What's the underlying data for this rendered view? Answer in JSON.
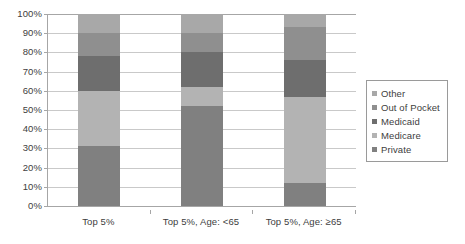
{
  "chart_data": {
    "type": "bar",
    "stacked": true,
    "title": "",
    "xlabel": "",
    "ylabel": "",
    "ylim": [
      0,
      100
    ],
    "ytick_labels": [
      "0%",
      "10%",
      "20%",
      "30%",
      "40%",
      "50%",
      "60%",
      "70%",
      "80%",
      "90%",
      "100%"
    ],
    "ytick_values": [
      0,
      10,
      20,
      30,
      40,
      50,
      60,
      70,
      80,
      90,
      100
    ],
    "grid": true,
    "legend_position": "right",
    "categories": [
      "Top 5%",
      "Top 5%, Age: <65",
      "Top 5%, Age: ≥65"
    ],
    "series": [
      {
        "name": "Private",
        "color": "#808080",
        "values": [
          31,
          52,
          12
        ]
      },
      {
        "name": "Medicare",
        "color": "#b3b3b3",
        "values": [
          29,
          10,
          45
        ]
      },
      {
        "name": "Medicaid",
        "color": "#6e6e6e",
        "values": [
          18,
          18,
          19
        ]
      },
      {
        "name": "Out of Pocket",
        "color": "#8f8f8f",
        "values": [
          12,
          10,
          17
        ]
      },
      {
        "name": "Other",
        "color": "#a8a8a8",
        "values": [
          10,
          10,
          7
        ]
      }
    ],
    "legend_entries": [
      {
        "label": "Other",
        "color": "#a8a8a8"
      },
      {
        "label": "Out of Pocket",
        "color": "#8f8f8f"
      },
      {
        "label": "Medicaid",
        "color": "#6e6e6e"
      },
      {
        "label": "Medicare",
        "color": "#b3b3b3"
      },
      {
        "label": "Private",
        "color": "#808080"
      }
    ]
  }
}
